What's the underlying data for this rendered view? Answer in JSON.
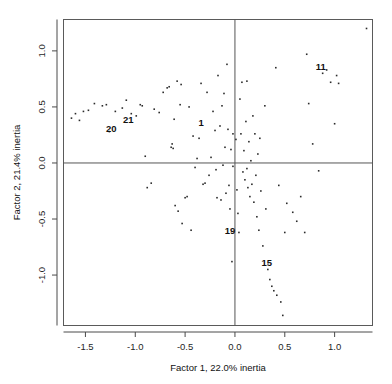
{
  "chart_data": {
    "type": "scatter",
    "title": "",
    "xlabel": "Factor 1, 22.0% inertia",
    "ylabel": "Factor 2, 21.4% inertia",
    "xlim": [
      -1.72,
      1.38
    ],
    "ylim": [
      -1.45,
      1.28
    ],
    "xticks": [
      "-1.5",
      "-1.0",
      "-0.5",
      "0.0",
      "0.5",
      "1.0"
    ],
    "xtick_values": [
      -1.5,
      -1.0,
      -0.5,
      0.0,
      0.5,
      1.0
    ],
    "yticks": [
      "-1.0",
      "-0.5",
      "0.0",
      "0.5",
      "1.0"
    ],
    "ytick_values": [
      -1.0,
      -0.5,
      0.0,
      0.5,
      1.0
    ],
    "grid": false,
    "legend": "none",
    "reference_lines": {
      "vertical_x": 0.0,
      "horizontal_y": 0.0
    },
    "marker": "point",
    "marker_color": "#2b2b2b",
    "points": [
      [
        -1.64,
        0.4
      ],
      [
        -1.6,
        0.44
      ],
      [
        -1.56,
        0.38
      ],
      [
        -1.52,
        0.46
      ],
      [
        -1.47,
        0.47
      ],
      [
        -1.41,
        0.53
      ],
      [
        -1.33,
        0.51
      ],
      [
        -1.29,
        0.52
      ],
      [
        -1.26,
        0.28
      ],
      [
        -1.2,
        0.46
      ],
      [
        -1.13,
        0.49
      ],
      [
        -1.09,
        0.56
      ],
      [
        -1.04,
        0.44
      ],
      [
        -0.99,
        0.42
      ],
      [
        -0.95,
        0.52
      ],
      [
        -0.93,
        0.51
      ],
      [
        -0.9,
        0.06
      ],
      [
        -0.88,
        -0.22
      ],
      [
        -0.84,
        -0.18
      ],
      [
        -0.81,
        0.48
      ],
      [
        -0.76,
        0.45
      ],
      [
        -0.72,
        0.63
      ],
      [
        -0.68,
        0.67
      ],
      [
        -0.66,
        0.68
      ],
      [
        -0.64,
        0.14
      ],
      [
        -0.63,
        0.17
      ],
      [
        -0.62,
        0.13
      ],
      [
        -0.61,
        0.39
      ],
      [
        -0.6,
        -0.38
      ],
      [
        -0.58,
        0.73
      ],
      [
        -0.57,
        -0.43
      ],
      [
        -0.55,
        0.52
      ],
      [
        -0.54,
        0.7
      ],
      [
        -0.53,
        -0.54
      ],
      [
        -0.5,
        -0.31
      ],
      [
        -0.48,
        -0.3
      ],
      [
        -0.46,
        0.5
      ],
      [
        -0.44,
        -0.6
      ],
      [
        -0.42,
        0.24
      ],
      [
        -0.4,
        -0.04
      ],
      [
        -0.38,
        0.04
      ],
      [
        -0.36,
        0.22
      ],
      [
        -0.34,
        0.71
      ],
      [
        -0.32,
        -0.19
      ],
      [
        -0.3,
        -0.18
      ],
      [
        -0.28,
        0.63
      ],
      [
        -0.26,
        -0.11
      ],
      [
        -0.24,
        0.05
      ],
      [
        -0.22,
        0.46
      ],
      [
        -0.2,
        0.29
      ],
      [
        -0.19,
        -0.06
      ],
      [
        -0.18,
        -0.31
      ],
      [
        -0.17,
        0.78
      ],
      [
        -0.15,
        0.33
      ],
      [
        -0.14,
        -0.33
      ],
      [
        -0.13,
        0.51
      ],
      [
        -0.12,
        -0.02
      ],
      [
        -0.11,
        0.62
      ],
      [
        -0.1,
        0.14
      ],
      [
        -0.09,
        -0.27
      ],
      [
        -0.08,
        0.88
      ],
      [
        -0.07,
        0.3
      ],
      [
        -0.06,
        -0.2
      ],
      [
        -0.05,
        -0.41
      ],
      [
        -0.04,
        0.12
      ],
      [
        -0.03,
        -0.88
      ],
      [
        -0.02,
        0.26
      ],
      [
        -0.02,
        -0.03
      ],
      [
        0.01,
        0.21
      ],
      [
        0.02,
        -0.24
      ],
      [
        0.03,
        -0.45
      ],
      [
        0.04,
        -0.62
      ],
      [
        0.05,
        0.57
      ],
      [
        0.06,
        0.26
      ],
      [
        0.07,
        0.72
      ],
      [
        0.08,
        -0.08
      ],
      [
        0.09,
        0.11
      ],
      [
        0.1,
        -0.15
      ],
      [
        0.11,
        0.37
      ],
      [
        0.12,
        -0.05
      ],
      [
        0.12,
        0.73
      ],
      [
        0.13,
        -0.22
      ],
      [
        0.14,
        0.19
      ],
      [
        0.15,
        -0.3
      ],
      [
        0.16,
        0.02
      ],
      [
        0.17,
        -0.19
      ],
      [
        0.18,
        0.42
      ],
      [
        0.19,
        -0.35
      ],
      [
        0.2,
        0.26
      ],
      [
        0.21,
        -0.11
      ],
      [
        0.22,
        -0.48
      ],
      [
        0.23,
        0.08
      ],
      [
        0.24,
        -0.6
      ],
      [
        0.25,
        0.22
      ],
      [
        0.26,
        -0.25
      ],
      [
        0.28,
        -0.74
      ],
      [
        0.3,
        0.51
      ],
      [
        0.31,
        -0.41
      ],
      [
        0.33,
        -0.95
      ],
      [
        0.35,
        -1.04
      ],
      [
        0.37,
        -1.1
      ],
      [
        0.39,
        -1.14
      ],
      [
        0.41,
        0.85
      ],
      [
        0.42,
        -1.18
      ],
      [
        0.44,
        -0.2
      ],
      [
        0.46,
        -1.24
      ],
      [
        0.48,
        -1.36
      ],
      [
        0.5,
        -0.62
      ],
      [
        0.52,
        -0.36
      ],
      [
        0.58,
        -0.44
      ],
      [
        0.62,
        -0.52
      ],
      [
        0.66,
        -0.3
      ],
      [
        0.7,
        -0.62
      ],
      [
        0.72,
        0.97
      ],
      [
        0.74,
        0.53
      ],
      [
        0.78,
        0.17
      ],
      [
        0.84,
        -0.07
      ],
      [
        0.88,
        0.8
      ],
      [
        0.92,
        0.83
      ],
      [
        0.96,
        0.72
      ],
      [
        1.0,
        0.35
      ],
      [
        1.02,
        0.78
      ],
      [
        1.04,
        0.71
      ],
      [
        1.32,
        1.2
      ]
    ],
    "labeled_points": [
      {
        "label": "1",
        "x": -0.34,
        "y": 0.33
      },
      {
        "label": "11",
        "x": 0.86,
        "y": 0.83
      },
      {
        "label": "15",
        "x": 0.32,
        "y": -0.92
      },
      {
        "label": "19",
        "x": -0.05,
        "y": -0.63
      },
      {
        "label": "20",
        "x": -1.24,
        "y": 0.28
      },
      {
        "label": "21",
        "x": -1.07,
        "y": 0.36
      }
    ]
  }
}
